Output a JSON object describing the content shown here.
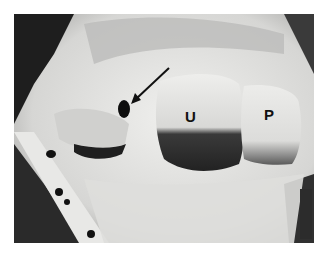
{
  "figure": {
    "type": "grayscale anatomical photograph",
    "labels": [
      {
        "id": "U",
        "text": "U"
      },
      {
        "id": "P",
        "text": "P"
      }
    ],
    "annotations": [
      {
        "type": "arrow",
        "points_to": "dark oval opening left of U"
      }
    ],
    "colors": {
      "background": "#ffffff",
      "tissue_light": "#e6e6e4",
      "tissue_mid": "#bdbdbb",
      "shadow": "#2a2a2a"
    }
  }
}
